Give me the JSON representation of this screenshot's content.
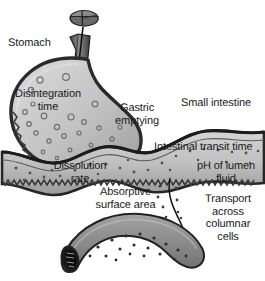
{
  "diagram": {
    "background_color": "#ffffff",
    "text_color": "#1a1a1a"
  },
  "labels": {
    "stomach": "Stomach",
    "disintegration_time": "Disintegration\ntime",
    "gastric_emptying": "Gastric\nemptying",
    "small_intestine": "Small intestine",
    "intestinal_transit_time": "Intestinal transit time",
    "dissolution_rate": "Dissolution\nrate",
    "ph_of_lumen_fluid": "pH of lumen\nfluid",
    "absorptive_surface_area": "Absorptive\nsurface area",
    "transport_across_columnar_cells": "Transport\nacross\ncolumnar\ncells"
  },
  "organs": {
    "tablet": {
      "name": "tablet",
      "fill": "#8c8c8c",
      "outline": "#2b2b2b"
    },
    "esophagus": {
      "name": "esophagus",
      "fill": "#6e6e6e",
      "outline": "#1f1f1f"
    },
    "stomach": {
      "name": "stomach",
      "fill_light": "#d6d6d6",
      "fill_dark": "#9a9a9a",
      "outline": "#2b2b2b"
    },
    "small_intestine": {
      "name": "small-intestine",
      "fill_light": "#cfcfcf",
      "fill_dark": "#9c9c9c",
      "outline": "#262626"
    },
    "columnar_tube": {
      "name": "columnar-cell-tube",
      "fill": "#8f8f8f",
      "outline": "#232323",
      "lumen_fill": "#1a1a1a"
    }
  },
  "particles": {
    "stomach_granules_color": "#7a7a7a",
    "intestine_particles_color": "#4f4f4f",
    "tube_particles_color": "#2e2e2e"
  },
  "arrows": {
    "swallow_arrow": "down-arrow-into-stomach",
    "absorption_arrow": "curved-arrow-to-columnar-cells"
  }
}
